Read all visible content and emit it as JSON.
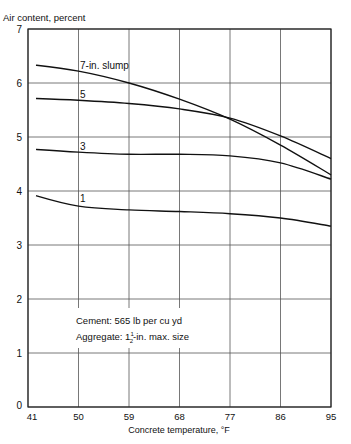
{
  "chart_data": {
    "type": "line",
    "title": "",
    "ylabel": "Air content, percent",
    "xlabel": "Concrete temperature, °F",
    "x": [
      41,
      50,
      59,
      68,
      77,
      86,
      95
    ],
    "xticks": [
      "41",
      "50",
      "59",
      "68",
      "77",
      "86",
      "95"
    ],
    "yticks": [
      "0",
      "1",
      "2",
      "3",
      "4",
      "5",
      "6",
      "7"
    ],
    "xlim": [
      41,
      95
    ],
    "ylim": [
      0,
      7
    ],
    "grid": true,
    "series": [
      {
        "name": "7-in. slump",
        "label": "7-in. slump",
        "values": [
          6.35,
          6.22,
          6.0,
          5.7,
          5.33,
          4.85,
          4.3
        ]
      },
      {
        "name": "5-in. slump",
        "label": "5",
        "values": [
          5.72,
          5.68,
          5.62,
          5.52,
          5.35,
          5.02,
          4.6
        ]
      },
      {
        "name": "3-in. slump",
        "label": "3",
        "values": [
          4.78,
          4.72,
          4.68,
          4.68,
          4.65,
          4.52,
          4.22
        ]
      },
      {
        "name": "1-in. slump",
        "label": "1",
        "values": [
          3.95,
          3.72,
          3.65,
          3.62,
          3.58,
          3.5,
          3.35
        ]
      }
    ],
    "annotations": [
      "Cement: 565 lb per cu yd",
      "Aggregate: 1½-in. max. size"
    ]
  },
  "labels": {
    "ylabel": "Air content, percent",
    "xlabel": "Concrete temperature, °F",
    "note_line1": "Cement: 565 lb per cu yd",
    "note_line2_prefix": "Aggregate: 1",
    "note_line2_frac_num": "1",
    "note_line2_frac_den": "2",
    "note_line2_suffix": "-in. max. size"
  }
}
